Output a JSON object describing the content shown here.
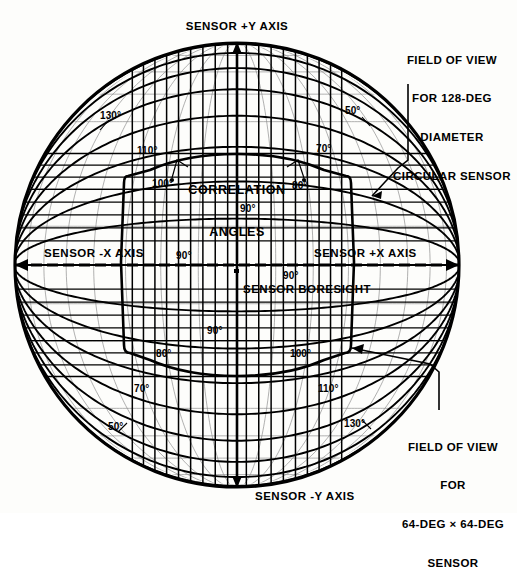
{
  "figure": {
    "type": "orthographic-globe-fov-diagram",
    "background_color": "#fdfdfb",
    "line_color": "#000000",
    "globe": {
      "center_x": 237,
      "center_y": 265,
      "radius": 223,
      "graticule_spacing_deg": 10
    }
  },
  "axes": {
    "plus_y": "SENSOR +Y AXIS",
    "minus_y": "SENSOR -Y AXIS",
    "plus_x": "SENSOR +X AXIS",
    "minus_x": "SENSOR -X AXIS",
    "boresight": "SENSOR BORESIGHT"
  },
  "callouts": {
    "circular_sensor": {
      "line1": "FIELD OF VIEW",
      "line2": "FOR 128-DEG",
      "line3": "DIAMETER",
      "line4": "CIRCULAR SENSOR"
    },
    "square_sensor": {
      "line1": "FIELD OF VIEW",
      "line2": "FOR",
      "line3": "64-DEG × 64-DEG",
      "line4": "SENSOR"
    },
    "correlation": {
      "line1": "CORRELATION",
      "line2": "ANGLES"
    }
  },
  "angle_labels": {
    "upper_left_130": "130°",
    "upper_left_110": "110°",
    "upper_left_100": "100°",
    "upper_right_50": "50°",
    "upper_right_70": "70°",
    "upper_right_80": "80°",
    "center_upper_90": "90°",
    "center_lower_90": "90°",
    "axis_left_90": "90°",
    "axis_right_90": "90°",
    "lower_left_80": "80°",
    "lower_left_70": "70°",
    "lower_left_50": "50°",
    "lower_right_100": "100°",
    "lower_right_110": "110°",
    "lower_right_130": "130°"
  },
  "chart_data": {
    "type": "diagram",
    "projection": "orthographic hemisphere",
    "graticule_deg": 10,
    "correlation_angle_values_deg": [
      50,
      70,
      80,
      90,
      100,
      110,
      130
    ],
    "fields_of_view": [
      {
        "name": "128-deg diameter circular sensor",
        "shape": "circle",
        "diameter_deg": 128
      },
      {
        "name": "64-deg x 64-deg sensor",
        "shape": "square",
        "width_deg": 64,
        "height_deg": 64
      }
    ]
  }
}
